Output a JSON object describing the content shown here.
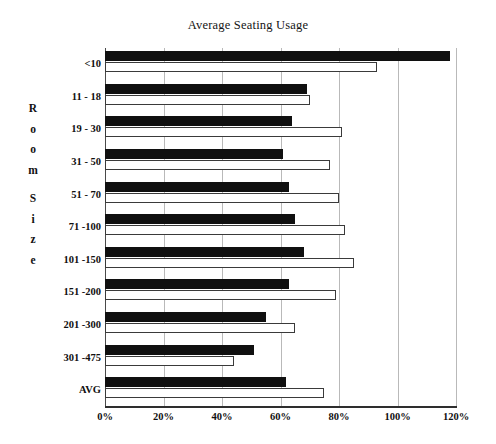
{
  "chart_data": {
    "type": "bar",
    "orientation": "horizontal",
    "title": "Average Seating Usage",
    "xlabel": "",
    "ylabel": "Room Size",
    "ylabel_letters": [
      "R",
      "o",
      "o",
      "m",
      "",
      "S",
      "i",
      "z",
      "e"
    ],
    "categories": [
      "<10",
      "11 - 18",
      "19 - 30",
      "31 - 50",
      "51 - 70",
      "71 -100",
      "101 -150",
      "151 -200",
      "201 -300",
      "301 -475",
      "AVG"
    ],
    "series": [
      {
        "name": "series-a",
        "color": "#101010",
        "fill": "solid-black",
        "values": [
          118,
          69,
          64,
          61,
          63,
          65,
          68,
          63,
          55,
          51,
          62
        ]
      },
      {
        "name": "series-b",
        "color": "#ffffff",
        "fill": "white-outline",
        "values": [
          93,
          70,
          81,
          77,
          80,
          82,
          85,
          79,
          65,
          44,
          75
        ]
      }
    ],
    "xlim": [
      0,
      120
    ],
    "xticks": [
      0,
      20,
      40,
      60,
      80,
      100,
      120
    ],
    "xtick_labels": [
      "0%",
      "20%",
      "40%",
      "60%",
      "80%",
      "100%",
      "120%"
    ],
    "grid": true,
    "grid_axis": "x",
    "legend": "none",
    "value_unit": "%"
  }
}
